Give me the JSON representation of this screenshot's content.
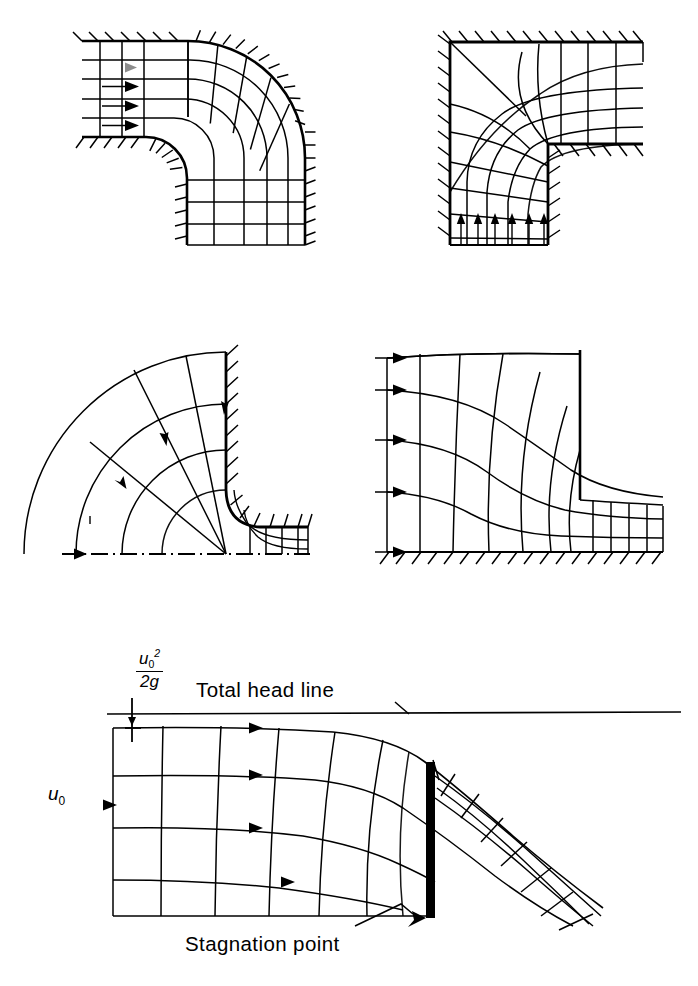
{
  "figure": {
    "panel_count": 5
  },
  "panels": [
    {
      "id": "rounded-bend",
      "name": "Flow net in a rounded 90-degree bend",
      "description": "Uniform flow entering from the left through a duct with rounded inner and outer corners, turning 90 degrees downward",
      "boundary_style": "hatched walls",
      "inlet_arrows": 4,
      "inlet_direction": "right",
      "streamline_count": 4,
      "equipotential_count": 9
    },
    {
      "id": "sharp-bend",
      "name": "Flow net in a sharp-cornered 90-degree elbow",
      "description": "Flow entering upward from below and turning to exit horizontally right at a square elbow; a diagonal separates the dead-water corner zone",
      "boundary_style": "hatched walls",
      "inlet_arrows": 6,
      "inlet_direction": "up",
      "streamline_count": 4,
      "equipotential_count": 10,
      "has_corner_diagonal": true
    },
    {
      "id": "radial-inflow-outlet",
      "name": "Radial flow into a vertical outlet pipe",
      "description": "Radially converging flow along a horizontal floor turning into a vertical pipe; the lower edge is a dash-dot symmetry axis",
      "boundary_style": "hatched walls with dash-dot centreline",
      "inlet_arrows": 1,
      "inlet_direction": "right",
      "flow_arrows": 4,
      "streamline_count": 4,
      "equipotential_count": 5
    },
    {
      "id": "sluice-gate",
      "name": "Flow net under a sluice gate",
      "description": "Uniform approach flow from the left accelerating beneath a vertical sluice gate and forming a contracted jet downstream",
      "boundary_style": "hatched floor",
      "inlet_arrows": 5,
      "inlet_direction": "right",
      "streamline_count": 5,
      "equipotential_count": 9
    },
    {
      "id": "sharp-crested-weir",
      "name": "Flow over a sharp-crested weir",
      "description": "Approach flow from the left with velocity u0 passing over a thin vertical weir plate; the nappe springs free and falls to the right",
      "boundary_style": "thin plate weir",
      "inlet_arrows": 5,
      "inlet_direction": "right",
      "streamline_count": 5,
      "equipotential_count": 10
    }
  ],
  "labels": {
    "total_head_line": "Total head line",
    "stagnation_point": "Stagnation point",
    "approach_velocity": "u",
    "approach_velocity_sub": "0",
    "velocity_head_numerator": "u",
    "velocity_head_numerator_sup": "2",
    "velocity_head_numerator_sub": "0",
    "velocity_head_denominator": "2g"
  },
  "colors": {
    "ink": "#000000",
    "background": "#ffffff",
    "plate_fill": "#000000"
  }
}
